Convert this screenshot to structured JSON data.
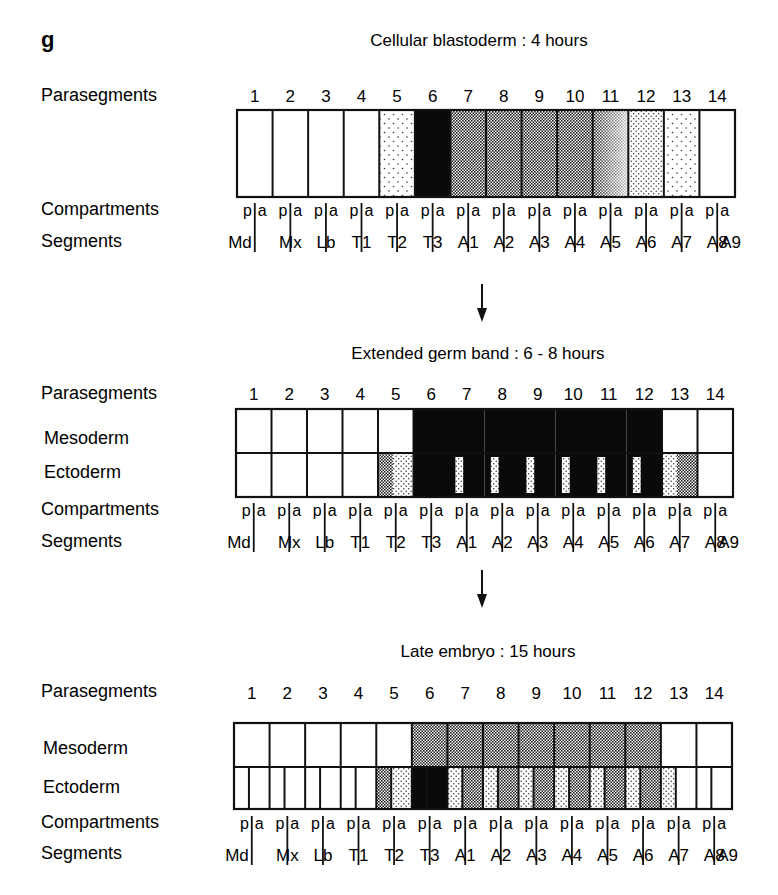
{
  "panel_letter": "g",
  "row_labels": {
    "parasegments": "Parasegments",
    "compartments": "Compartments",
    "segments": "Segments",
    "mesoderm": "Mesoderm",
    "ectoderm": "Ectoderm"
  },
  "parasegments": [
    "1",
    "2",
    "3",
    "4",
    "5",
    "6",
    "7",
    "8",
    "9",
    "10",
    "11",
    "12",
    "13",
    "14"
  ],
  "compartment_pairs": [
    "p",
    "a"
  ],
  "segments": [
    "Md",
    "Mx",
    "Lb",
    "T1",
    "T2",
    "T3",
    "A1",
    "A2",
    "A3",
    "A4",
    "A5",
    "A6",
    "A7",
    "A8",
    "A9"
  ],
  "pattern_legend": {
    "white": "no expression",
    "sparse": "sparse stipple (low)",
    "light": "light stipple",
    "dense": "dense stipple (high)",
    "black": "solid (highest)",
    "gradient": "dense-to-light gradient"
  },
  "stages": [
    {
      "title": "Cellular blastoderm : 4 hours",
      "layers": [
        "single"
      ],
      "fills": {
        "single": [
          "white",
          "white",
          "white",
          "white",
          "sparse",
          "black",
          "dense",
          "dense",
          "dense",
          "dense",
          "gradient",
          "light",
          "sparse",
          "white"
        ]
      }
    },
    {
      "title": "Extended germ band : 6 - 8 hours",
      "layers": [
        "mesoderm",
        "ectoderm"
      ],
      "fills": {
        "mesoderm": [
          "white",
          "white",
          "white",
          "white",
          "white",
          "black",
          "black",
          "black",
          "black",
          "black",
          "black",
          "black",
          "white",
          "white"
        ],
        "ectoderm": [
          "white",
          "white",
          "white",
          "white",
          "dense|light",
          "black",
          "light-stripe|black",
          "light-stripe|black",
          "light-stripe|black",
          "light-stripe|black",
          "light-stripe|black",
          "light-stripe|black",
          "light|dense",
          "white"
        ]
      }
    },
    {
      "title": "Late embryo : 15 hours",
      "layers": [
        "mesoderm",
        "ectoderm"
      ],
      "fills": {
        "mesoderm": [
          "white",
          "white",
          "white",
          "white",
          "white",
          "dense",
          "dense",
          "dense",
          "dense",
          "dense",
          "dense",
          "dense",
          "white",
          "white"
        ],
        "ectoderm": [
          "white|white",
          "white|white",
          "white|white",
          "white|white",
          "dense|light",
          "black|black",
          "light|dense",
          "light|dense",
          "light|dense",
          "light|dense",
          "light|dense",
          "light|dense",
          "light|white",
          "white|white"
        ]
      }
    }
  ]
}
